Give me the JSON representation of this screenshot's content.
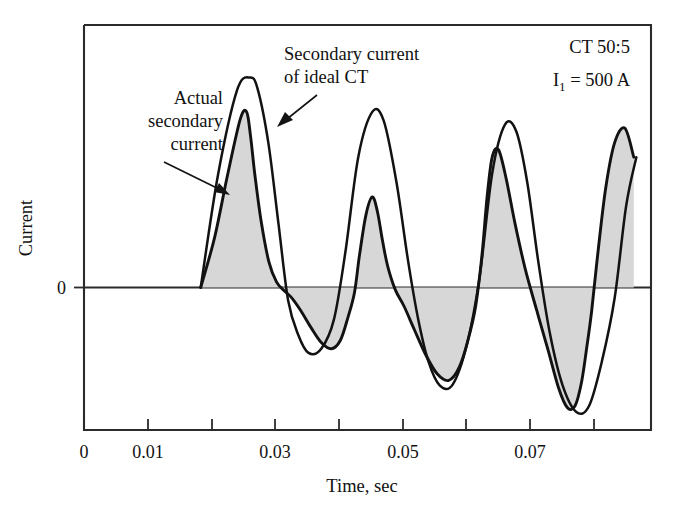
{
  "figure": {
    "background_color": "#ffffff",
    "line_color": "#121212",
    "fill_color": "#d7d7d7"
  },
  "axes": {
    "x_title": "Time, sec",
    "y_title": "Current",
    "y_zero_label": "0",
    "x_tick_labels": [
      "0",
      "0.01",
      "0.03",
      "0.05",
      "0.07"
    ]
  },
  "annotations": {
    "actual": {
      "line1": "Actual",
      "line2": "secondary",
      "line3": "current"
    },
    "ideal": {
      "line1": "Secondary current",
      "line2": "of ideal CT"
    },
    "rating": {
      "line1": "CT 50:5",
      "line2_prefix": "I",
      "line2_sub": "1",
      "line2_suffix": " = 500 A"
    }
  },
  "chart_data": {
    "type": "line",
    "title": "",
    "xlabel": "Time, sec",
    "ylabel": "Current",
    "xlim": [
      0,
      0.0889
    ],
    "ylim": [
      -1.35,
      1.45
    ],
    "grid": false,
    "legend": null,
    "x_ticks": [
      0,
      0.01,
      0.02,
      0.03,
      0.04,
      0.05,
      0.06,
      0.07,
      0.08
    ],
    "x_tick_labels": [
      "0",
      "0.01",
      "",
      "0.03",
      "",
      "0.05",
      "",
      "0.07",
      ""
    ],
    "y_ticks": [
      0
    ],
    "y_tick_labels": [
      "0"
    ],
    "annotations_text": [
      "Actual secondary current",
      "Secondary current of ideal CT",
      "CT 50:5",
      "I1 = 500 A"
    ],
    "series": [
      {
        "name": "Secondary current of ideal CT",
        "style": "solid-line",
        "fill": false,
        "x": [
          0.0183,
          0.021,
          0.024,
          0.026,
          0.0272,
          0.0289,
          0.0305,
          0.032,
          0.0336,
          0.0352,
          0.0372,
          0.0392,
          0.041,
          0.043,
          0.0452,
          0.047,
          0.049,
          0.0508,
          0.0524,
          0.054,
          0.0558,
          0.0578,
          0.06,
          0.062,
          0.064,
          0.066,
          0.0678,
          0.0695,
          0.0712,
          0.073,
          0.075,
          0.0772,
          0.0792,
          0.0812,
          0.0832,
          0.085,
          0.0866
        ],
        "y": [
          0.0,
          0.62,
          1.09,
          1.16,
          1.1,
          0.8,
          0.35,
          -0.12,
          -0.45,
          -0.62,
          -0.58,
          -0.3,
          0.2,
          0.72,
          0.97,
          0.92,
          0.58,
          0.15,
          -0.3,
          -0.7,
          -0.93,
          -0.92,
          -0.55,
          0.05,
          0.63,
          0.9,
          0.86,
          0.58,
          0.15,
          -0.42,
          -0.92,
          -1.18,
          -1.12,
          -0.7,
          -0.1,
          0.45,
          0.72
        ]
      },
      {
        "name": "Actual secondary current",
        "style": "solid-line-shaded",
        "fill": true,
        "fill_color": "#d7d7d7",
        "x": [
          0.0183,
          0.0205,
          0.0225,
          0.0245,
          0.0255,
          0.0261,
          0.0268,
          0.0278,
          0.029,
          0.0302,
          0.0314,
          0.0326,
          0.034,
          0.0356,
          0.0372,
          0.0388,
          0.0402,
          0.0414,
          0.0424,
          0.0432,
          0.0442,
          0.0452,
          0.046,
          0.0468,
          0.0476,
          0.0488,
          0.0502,
          0.0518,
          0.0536,
          0.0554,
          0.0572,
          0.0588,
          0.0602,
          0.0614,
          0.0624,
          0.0632,
          0.064,
          0.065,
          0.0662,
          0.0676,
          0.0692,
          0.071,
          0.0728,
          0.0744,
          0.0758,
          0.077,
          0.078,
          0.0788,
          0.0796,
          0.0806,
          0.0818,
          0.0832,
          0.0848,
          0.0862
        ],
        "y": [
          0.0,
          0.28,
          0.62,
          0.93,
          0.97,
          0.84,
          0.62,
          0.36,
          0.14,
          0.03,
          -0.03,
          -0.1,
          -0.22,
          -0.38,
          -0.52,
          -0.58,
          -0.5,
          -0.28,
          -0.05,
          0.18,
          0.4,
          0.5,
          0.42,
          0.26,
          0.12,
          -0.02,
          -0.18,
          -0.4,
          -0.64,
          -0.82,
          -0.88,
          -0.76,
          -0.5,
          -0.18,
          0.18,
          0.5,
          0.72,
          0.76,
          0.6,
          0.35,
          0.1,
          -0.22,
          -0.6,
          -0.95,
          -1.14,
          -1.12,
          -0.9,
          -0.58,
          -0.22,
          0.2,
          0.55,
          0.8,
          0.88,
          0.72
        ]
      }
    ]
  }
}
